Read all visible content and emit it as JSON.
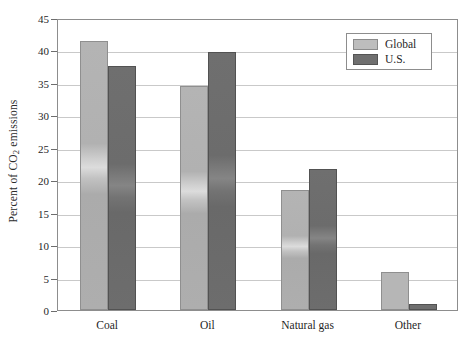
{
  "chart_data": {
    "type": "bar",
    "title": "",
    "xlabel": "",
    "ylabel": "Percent of CO2 emissions",
    "ylabel_prefix": "Percent of CO",
    "ylabel_sub": "2",
    "ylabel_suffix": " emissions",
    "categories": [
      "Coal",
      "Oil",
      "Natural gas",
      "Other"
    ],
    "series": [
      {
        "name": "Global",
        "color": "#b6b6b6",
        "values": [
          41.5,
          34.5,
          18.5,
          5.9
        ]
      },
      {
        "name": "U.S.",
        "color": "#6f6f6f",
        "values": [
          37.6,
          39.8,
          21.8,
          1.0
        ]
      }
    ],
    "ylim": [
      0,
      45
    ],
    "ytick_step": 5,
    "yticks": [
      "0",
      "5",
      "10",
      "15",
      "20",
      "25",
      "30",
      "35",
      "40",
      "45"
    ],
    "grid": true,
    "legend_position": "top-right",
    "legend_entries": [
      "Global",
      "U.S."
    ]
  }
}
